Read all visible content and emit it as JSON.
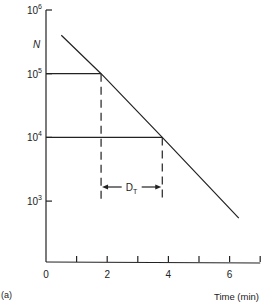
{
  "chart_data": {
    "type": "line",
    "title": "",
    "panel_label": "(a)",
    "xlabel": "Time (min)",
    "ylabel": "N",
    "yscale": "log",
    "xlim": [
      0,
      7
    ],
    "ylim": [
      1000,
      1000000
    ],
    "x_ticks": [
      0,
      1,
      2,
      3,
      4,
      5,
      6,
      7
    ],
    "x_tick_labels": [
      "0",
      "2",
      "4",
      "6"
    ],
    "x_tick_label_values": [
      0,
      2,
      4,
      6
    ],
    "y_ticks": [
      1000,
      10000,
      100000,
      1000000
    ],
    "y_tick_labels": [
      {
        "base": "10",
        "exp": "3"
      },
      {
        "base": "10",
        "exp": "4"
      },
      {
        "base": "10",
        "exp": "5"
      },
      {
        "base": "10",
        "exp": "6"
      }
    ],
    "grid": false,
    "legend": null,
    "series": [
      {
        "name": "Survivors N",
        "x": [
          0.5,
          1.8,
          3.8,
          6.3
        ],
        "y": [
          400000,
          100000,
          10000,
          540
        ]
      }
    ],
    "annotations": [
      {
        "type": "hline",
        "y": 100000,
        "x_from": 0,
        "x_to": 1.8
      },
      {
        "type": "hline",
        "y": 10000,
        "x_from": 0,
        "x_to": 3.8
      },
      {
        "type": "vline-dashed",
        "x": 1.8
      },
      {
        "type": "vline-dashed",
        "x": 3.8
      },
      {
        "type": "double-arrow",
        "from": 1.8,
        "to": 3.8,
        "label": "D",
        "label_sub": "T"
      }
    ],
    "decimal_reduction_time_min": 2.0
  }
}
